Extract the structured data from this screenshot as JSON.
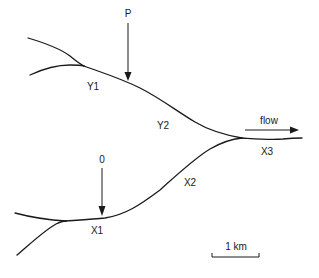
{
  "diagram": {
    "type": "river confluence schematic",
    "labels": {
      "P": "P",
      "origin": "0",
      "Y1": "Y1",
      "Y2": "Y2",
      "X1": "X1",
      "X2": "X2",
      "X3": "X3",
      "flow": "flow"
    },
    "scale_bar": {
      "label": "1 km"
    },
    "colors": {
      "ink": "#1a1a1a",
      "background": "#ffffff"
    }
  }
}
